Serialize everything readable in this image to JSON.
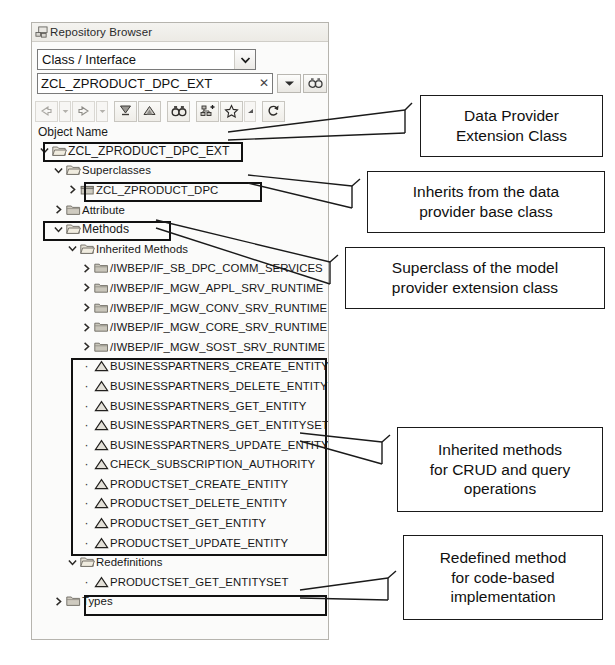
{
  "panel": {
    "title": "Repository Browser",
    "header_icon": "repository-browser-icon",
    "combo": {
      "value": "Class / Interface",
      "dropdown_icon": "chevron-down-icon"
    },
    "search": {
      "value": "ZCL_ZPRODUCT_DPC_EXT",
      "placeholder": "",
      "clear_icon": "clear-x-icon",
      "history_icon": "chevron-down-icon",
      "go_icon": "binoculars-icon"
    },
    "toolbar": [
      {
        "name": "back-button",
        "icon": "arrow-left-icon"
      },
      {
        "name": "back-history-button",
        "icon": "chevron-down-small-icon"
      },
      {
        "name": "forward-button",
        "icon": "arrow-right-icon"
      },
      {
        "name": "forward-history-button",
        "icon": "chevron-down-small-icon"
      },
      {
        "name": "collapse-all-button",
        "icon": "collapse-all-icon"
      },
      {
        "name": "link-to-editor-button",
        "icon": "link-editor-icon"
      },
      {
        "name": "find-button",
        "icon": "binoculars-icon"
      },
      {
        "name": "add-object-button",
        "icon": "add-node-icon"
      },
      {
        "name": "favorites-button",
        "icon": "star-icon"
      },
      {
        "name": "favorites-menu-button",
        "icon": "chevron-down-small-icon"
      },
      {
        "name": "refresh-button",
        "icon": "refresh-icon"
      }
    ],
    "tree_column_header": "Object Name",
    "tree": [
      {
        "label": "ZCL_ZPRODUCT_DPC_EXT",
        "indent": 0,
        "state": "expanded",
        "icon": "folder-open-icon",
        "size": "normal"
      },
      {
        "label": "Superclasses",
        "indent": 1,
        "state": "expanded",
        "icon": "folder-open-icon",
        "size": "small"
      },
      {
        "label": "ZCL_ZPRODUCT_DPC",
        "indent": 2,
        "state": "collapsed",
        "icon": "class-icon",
        "size": "small"
      },
      {
        "label": "Attribute",
        "indent": 1,
        "state": "collapsed",
        "icon": "folder-icon",
        "size": "small"
      },
      {
        "label": "Methods",
        "indent": 1,
        "state": "expanded",
        "icon": "folder-open-icon",
        "size": "normal"
      },
      {
        "label": "Inherited Methods",
        "indent": 2,
        "state": "expanded",
        "icon": "folder-open-icon",
        "size": "small"
      },
      {
        "label": "/IWBEP/IF_SB_DPC_COMM_SERVICES",
        "indent": 3,
        "state": "collapsed",
        "icon": "interface-icon",
        "size": "small"
      },
      {
        "label": "/IWBEP/IF_MGW_APPL_SRV_RUNTIME",
        "indent": 3,
        "state": "collapsed",
        "icon": "interface-icon",
        "size": "small"
      },
      {
        "label": "/IWBEP/IF_MGW_CONV_SRV_RUNTIME",
        "indent": 3,
        "state": "collapsed",
        "icon": "interface-icon",
        "size": "small"
      },
      {
        "label": "/IWBEP/IF_MGW_CORE_SRV_RUNTIME",
        "indent": 3,
        "state": "collapsed",
        "icon": "interface-icon",
        "size": "small"
      },
      {
        "label": "/IWBEP/IF_MGW_SOST_SRV_RUNTIME",
        "indent": 3,
        "state": "collapsed",
        "icon": "interface-icon",
        "size": "small"
      },
      {
        "label": "BUSINESSPARTNERS_CREATE_ENTITY",
        "indent": 3,
        "state": "leaf",
        "icon": "method-icon",
        "size": "small"
      },
      {
        "label": "BUSINESSPARTNERS_DELETE_ENTITY",
        "indent": 3,
        "state": "leaf",
        "icon": "method-icon",
        "size": "small"
      },
      {
        "label": "BUSINESSPARTNERS_GET_ENTITY",
        "indent": 3,
        "state": "leaf",
        "icon": "method-icon",
        "size": "small"
      },
      {
        "label": "BUSINESSPARTNERS_GET_ENTITYSET",
        "indent": 3,
        "state": "leaf",
        "icon": "method-icon",
        "size": "small"
      },
      {
        "label": "BUSINESSPARTNERS_UPDATE_ENTITY",
        "indent": 3,
        "state": "leaf",
        "icon": "method-icon",
        "size": "small"
      },
      {
        "label": "CHECK_SUBSCRIPTION_AUTHORITY",
        "indent": 3,
        "state": "leaf",
        "icon": "method-icon",
        "size": "small"
      },
      {
        "label": "PRODUCTSET_CREATE_ENTITY",
        "indent": 3,
        "state": "leaf",
        "icon": "method-icon",
        "size": "small"
      },
      {
        "label": "PRODUCTSET_DELETE_ENTITY",
        "indent": 3,
        "state": "leaf",
        "icon": "method-icon",
        "size": "small"
      },
      {
        "label": "PRODUCTSET_GET_ENTITY",
        "indent": 3,
        "state": "leaf",
        "icon": "method-icon",
        "size": "small"
      },
      {
        "label": "PRODUCTSET_UPDATE_ENTITY",
        "indent": 3,
        "state": "leaf",
        "icon": "method-icon",
        "size": "small"
      },
      {
        "label": "Redefinitions",
        "indent": 2,
        "state": "expanded",
        "icon": "folder-open-icon",
        "size": "small"
      },
      {
        "label": "PRODUCTSET_GET_ENTITYSET",
        "indent": 3,
        "state": "leaf",
        "icon": "method-icon",
        "size": "small"
      },
      {
        "label": "Types",
        "indent": 1,
        "state": "collapsed",
        "icon": "folder-icon",
        "size": "small"
      }
    ]
  },
  "annotations": [
    {
      "name": "callout-data-provider-extension-class",
      "lines": [
        "Data Provider",
        "Extension Class"
      ]
    },
    {
      "name": "callout-inherits-base-class",
      "lines": [
        "Inherits from the data",
        "provider base class"
      ]
    },
    {
      "name": "callout-superclass-model-provider",
      "lines": [
        "Superclass of the model",
        "provider extension class"
      ]
    },
    {
      "name": "callout-inherited-crud-methods",
      "lines": [
        "Inherited methods",
        "for CRUD and query",
        "operations"
      ]
    },
    {
      "name": "callout-redefined-method",
      "lines": [
        "Redefined method",
        "for code-based",
        "implementation"
      ]
    }
  ],
  "colors": {
    "annotation_border": "#1a1a1a",
    "highlight_border": "#111111",
    "panel_bg": "#fbfbfa",
    "panel_border": "#b6b4ae",
    "text": "#171717"
  }
}
